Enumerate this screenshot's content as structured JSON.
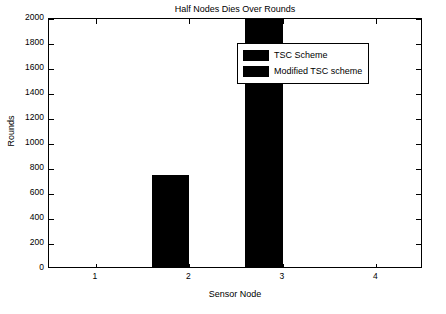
{
  "chart_data": {
    "type": "bar",
    "title": "Half Nodes Dies Over Rounds",
    "xlabel": "Sensor Node",
    "ylabel": "Rounds",
    "categories": [
      "1",
      "2",
      "3",
      "4"
    ],
    "series": [
      {
        "name": "TSC Scheme",
        "values": [
          0,
          740,
          1990,
          0
        ],
        "color": "#000000"
      },
      {
        "name": "Modified TSC scheme",
        "values": [
          0,
          0,
          0,
          0
        ],
        "color": "#000000"
      }
    ],
    "ylim": [
      0,
      2000
    ],
    "yticks": [
      "0",
      "200",
      "400",
      "600",
      "800",
      "1000",
      "1200",
      "1400",
      "1600",
      "1800",
      "2000"
    ],
    "xticks": [
      "1",
      "2",
      "3",
      "4"
    ],
    "grid": false,
    "legend_position": "top-center"
  },
  "legend": {
    "entries": [
      {
        "label": "TSC Scheme"
      },
      {
        "label": "Modified TSC scheme"
      }
    ]
  }
}
